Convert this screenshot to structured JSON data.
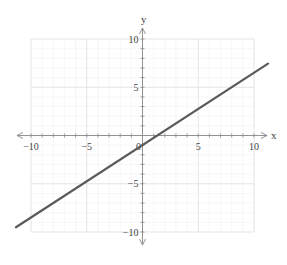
{
  "chart_data": {
    "type": "line",
    "title": "",
    "xlabel": "x",
    "ylabel": "y",
    "xlim": [
      -10,
      10
    ],
    "ylim": [
      -10,
      10
    ],
    "x_ticks": [
      -10,
      -5,
      0,
      5,
      10
    ],
    "y_ticks": [
      -10,
      -5,
      5,
      10
    ],
    "x_tick_labels": [
      "-10",
      "-5",
      "0",
      "5",
      "10"
    ],
    "y_tick_labels": [
      "-10",
      "-5",
      "5",
      "10"
    ],
    "origin_label": "0",
    "grid": true,
    "minor_grid_step": 1,
    "major_grid_step": 5,
    "legend": null,
    "series": [
      {
        "name": "line",
        "equation": "y = 0.75x - 1",
        "slope": 0.75,
        "intercept": -1,
        "x": [
          -11.35,
          11.26
        ],
        "y": [
          -9.51,
          7.45
        ],
        "color": "#5a5a5a"
      }
    ]
  },
  "colors": {
    "axis": "#888888",
    "grid_minor": "#eeeeee",
    "grid_major": "#dddddd",
    "line": "#5a5a5a",
    "text": "#444444"
  }
}
